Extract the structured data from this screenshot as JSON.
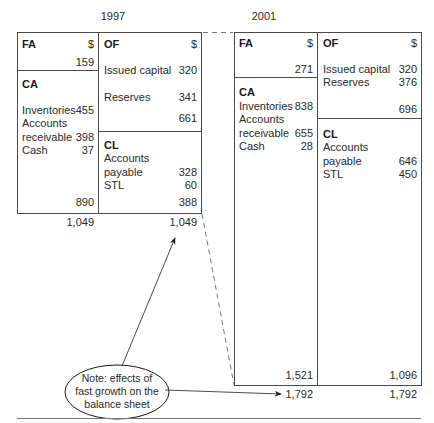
{
  "years": {
    "left": "1997",
    "right": "2001"
  },
  "bs1997": {
    "fa": {
      "heading": "FA",
      "currency": "$",
      "value": "159"
    },
    "ca": {
      "heading": "CA",
      "items": [
        {
          "label": "Inventories",
          "value": "455"
        },
        {
          "label": "Accounts",
          "value": ""
        },
        {
          "label": "receivable",
          "value": "398"
        },
        {
          "label": "Cash",
          "value": "37"
        }
      ],
      "subtotal": "890"
    },
    "of": {
      "heading": "OF",
      "currency": "$",
      "items": [
        {
          "label": "Issued capital",
          "value": "320"
        },
        {
          "label": "Reserves",
          "value": "341"
        }
      ],
      "subtotal": "661"
    },
    "cl": {
      "heading": "CL",
      "items": [
        {
          "label": "Accounts",
          "value": ""
        },
        {
          "label": "payable",
          "value": "328"
        },
        {
          "label": "STL",
          "value": "60"
        }
      ],
      "subtotal": "388"
    },
    "total_assets": "1,049",
    "total_liabilities": "1,049"
  },
  "bs2001": {
    "fa": {
      "heading": "FA",
      "currency": "$",
      "value": "271"
    },
    "ca": {
      "heading": "CA",
      "items": [
        {
          "label": "Inventories",
          "value": "838"
        },
        {
          "label": "Accounts",
          "value": ""
        },
        {
          "label": "receivable",
          "value": "655"
        },
        {
          "label": "Cash",
          "value": "28"
        }
      ],
      "subtotal": "1,521"
    },
    "of": {
      "heading": "OF",
      "currency": "$",
      "items": [
        {
          "label": "Issued capital",
          "value": "320"
        },
        {
          "label": "Reserves",
          "value": "376"
        }
      ],
      "subtotal": "696"
    },
    "cl": {
      "heading": "CL",
      "items": [
        {
          "label": "Accounts",
          "value": ""
        },
        {
          "label": "payable",
          "value": "646"
        },
        {
          "label": "STL",
          "value": "450"
        }
      ],
      "subtotal": "1,096"
    },
    "total_assets": "1,792",
    "total_liabilities": "1,792"
  },
  "note": {
    "line1": "Note: effects of",
    "line2": "fast growth on the",
    "line3": "balance sheet"
  },
  "colors": {
    "line": "#4a4a4a",
    "text": "#2a2a2a",
    "dash": "#777777"
  }
}
